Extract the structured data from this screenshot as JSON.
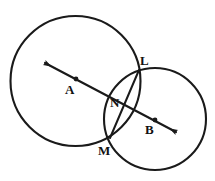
{
  "figure": {
    "type": "geometry-diagram",
    "background_color": "#ffffff",
    "stroke_color": "#1a1a1a",
    "width": 215,
    "height": 181,
    "labels": {
      "center_a": "A",
      "center_b": "B",
      "intersection_top": "L",
      "intersection_bottom": "M",
      "chord_crossing": "N"
    },
    "shapes": {
      "circle_a": {
        "cx": 75.5,
        "cy": 81,
        "r": 65
      },
      "circle_b": {
        "cx": 155,
        "cy": 119,
        "r": 51
      },
      "chord_lm": {
        "x1": 139,
        "y1": 70,
        "x2": 110,
        "y2": 138
      },
      "line_ab": {
        "x1": 41,
        "y1": 61,
        "x2": 180,
        "y2": 134,
        "arrows": "both"
      },
      "point_a_dot": {
        "cx": 76,
        "cy": 79
      },
      "point_b_dot": {
        "cx": 155,
        "cy": 120
      },
      "point_l": {
        "cx": 139,
        "cy": 70
      },
      "point_m": {
        "cx": 110,
        "cy": 138
      }
    },
    "label_positions": {
      "A": {
        "left": 65,
        "top": 83
      },
      "B": {
        "left": 145,
        "top": 123
      },
      "L": {
        "left": 140,
        "top": 54
      },
      "M": {
        "left": 98,
        "top": 144
      },
      "N": {
        "left": 110,
        "top": 96
      }
    }
  }
}
